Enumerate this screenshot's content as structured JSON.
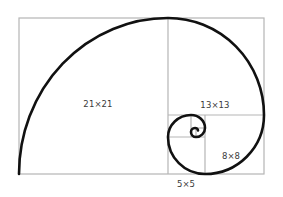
{
  "diagram": {
    "colors": {
      "background": "#ffffff",
      "grid_line": "#b5b5b5",
      "spiral": "#111111",
      "label": "#3a3a3a"
    },
    "squares": [
      {
        "id": "sq21",
        "label": "21×21",
        "size": 21
      },
      {
        "id": "sq13",
        "label": "13×13",
        "size": 13
      },
      {
        "id": "sq8",
        "label": "8×8",
        "size": 8
      },
      {
        "id": "sq5",
        "label": "5×5",
        "size": 5
      }
    ]
  }
}
